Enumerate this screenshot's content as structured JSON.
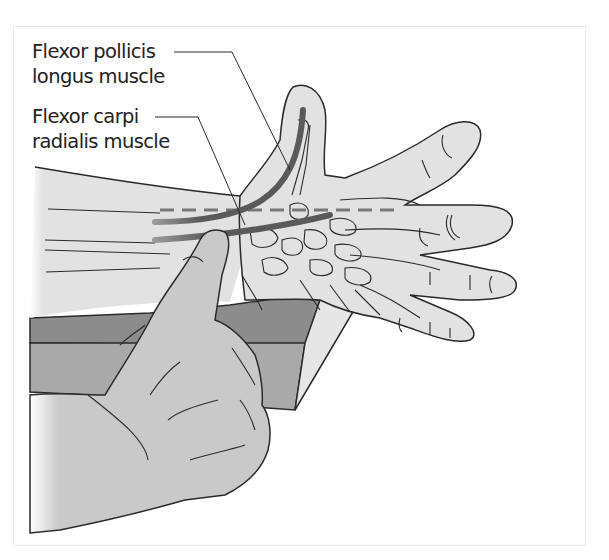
{
  "figure": {
    "labels": [
      {
        "id": "fpl",
        "line1": "Flexor pollicis",
        "line2": "longus muscle"
      },
      {
        "id": "fcr",
        "line1": "Flexor carpi",
        "line2": "radialis muscle"
      }
    ],
    "colors": {
      "outline": "#2a2a2a",
      "skin_patient": "#e2e2e2",
      "skin_examiner": "#c9c9c9",
      "table_top": "#8c8c8c",
      "table_front": "#a9a9a9",
      "table_side": "#e6e6e6",
      "tendon": "#555555",
      "frame_border": "#e8e8e8"
    }
  }
}
